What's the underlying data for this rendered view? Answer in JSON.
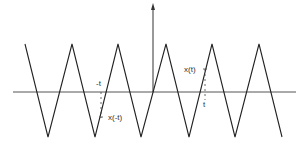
{
  "figure": {
    "type": "triangle-wave",
    "axes": {
      "horizontal": {
        "x1": 13,
        "x2": 296,
        "y": 92
      },
      "vertical": {
        "x": 153,
        "y1": 92,
        "y2": 5,
        "arrow": true
      }
    },
    "waveform_points": [
      [
        25,
        44
      ],
      [
        48,
        137
      ],
      [
        72,
        44
      ],
      [
        95,
        137
      ],
      [
        118,
        44
      ],
      [
        141,
        137
      ],
      [
        166,
        44
      ],
      [
        189,
        137
      ],
      [
        212,
        44
      ],
      [
        235,
        137
      ],
      [
        259,
        44
      ],
      [
        282,
        137
      ]
    ],
    "annotations": {
      "neg_t_label": "-t",
      "neg_t_value_label": "x(-t)",
      "t_label": "t",
      "t_value_label": "x(t)"
    },
    "colors": {
      "line": "#222222",
      "axis": "#444444"
    }
  }
}
